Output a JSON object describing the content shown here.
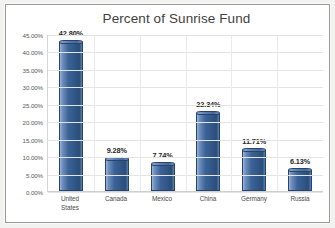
{
  "chart_data": {
    "type": "bar",
    "title": "Percent of Sunrise Fund",
    "xlabel": "",
    "ylabel": "",
    "categories": [
      "United States",
      "Canada",
      "Mexico",
      "China",
      "Germany",
      "Russia"
    ],
    "category_lines": [
      [
        "United",
        "States"
      ],
      [
        "Canada"
      ],
      [
        "Mexico"
      ],
      [
        "China"
      ],
      [
        "Germany"
      ],
      [
        "Russia"
      ]
    ],
    "values": [
      42.8,
      9.28,
      7.74,
      22.34,
      11.71,
      6.13
    ],
    "data_labels": [
      "42.80%",
      "9.28%",
      "7.74%",
      "22.34%",
      "11.71%",
      "6.13%"
    ],
    "ylim": [
      0,
      45
    ],
    "ytick_step": 5,
    "ytick_labels": [
      "45.00%",
      "40.00%",
      "35.00%",
      "30.00%",
      "25.00%",
      "20.00%",
      "15.00%",
      "10.00%",
      "5.00%",
      "0.00%"
    ],
    "ytick_values": [
      45,
      40,
      35,
      30,
      25,
      20,
      15,
      10,
      5,
      0
    ],
    "grid": true,
    "legend": false,
    "bar_color": "#31578a",
    "bar_highlight_color": "#9db4d4",
    "bar_border_color": "#27456c",
    "gridline_color": "#e4e4e4",
    "title_color": "#3f3f3f",
    "axis_text_color": "#595959",
    "plot_background": "#ffffff",
    "frame_border_color": "#9a9a9a"
  }
}
